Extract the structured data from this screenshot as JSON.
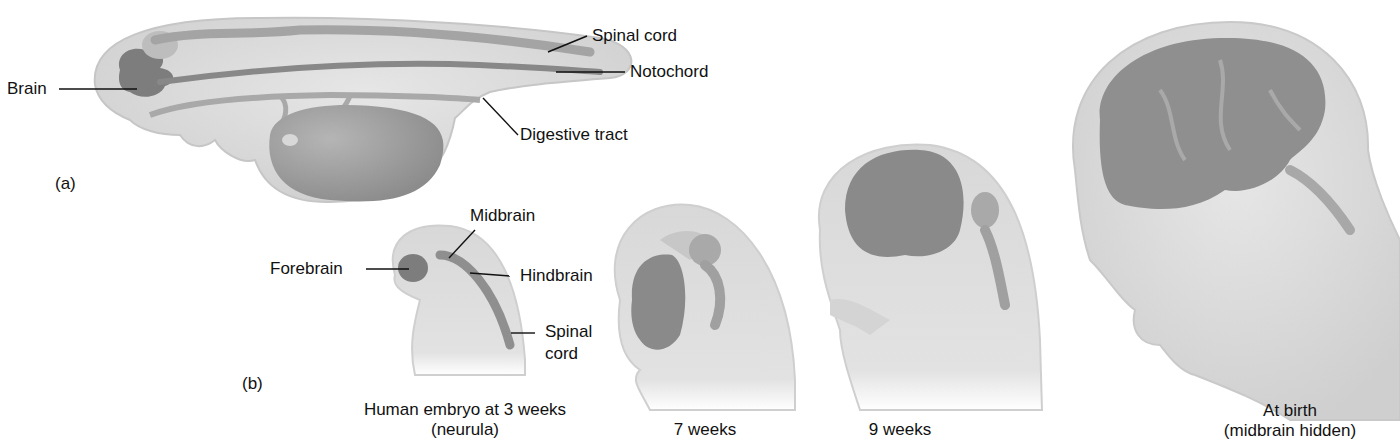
{
  "figure": {
    "panel_a": {
      "marker": "(a)",
      "labels": {
        "brain": "Brain",
        "spinal_cord": "Spinal cord",
        "notochord": "Notochord",
        "digestive_tract": "Digestive tract"
      }
    },
    "panel_b": {
      "marker": "(b)",
      "labels": {
        "forebrain": "Forebrain",
        "midbrain": "Midbrain",
        "hindbrain": "Hindbrain",
        "spinal_cord_line1": "Spinal",
        "spinal_cord_line2": "cord"
      },
      "stages": [
        {
          "caption_line1": "Human embryo at 3 weeks",
          "caption_line2": "(neurula)"
        },
        {
          "caption_line1": "7 weeks",
          "caption_line2": ""
        },
        {
          "caption_line1": "9 weeks",
          "caption_line2": ""
        },
        {
          "caption_line1": "At birth",
          "caption_line2": "(midbrain hidden)"
        }
      ]
    },
    "colors": {
      "body_fill": "#dcdcdc",
      "body_edge": "#c4c4c4",
      "organ_fill": "#9a9a9a",
      "brain_fill": "#8a8a8a",
      "leader_line": "#111111"
    }
  }
}
